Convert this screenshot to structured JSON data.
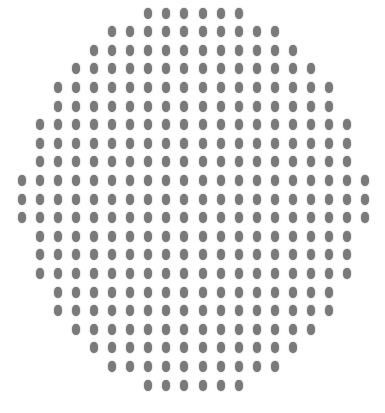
{
  "figure": {
    "dot_color": "#7a7a7a",
    "background": "#ffffff",
    "grid": {
      "origin_x": 22,
      "origin_y": 13,
      "col_spacing": 18.05,
      "row_spacing": 18.6,
      "columns": 20,
      "dot_width": 8,
      "dot_height": 11
    },
    "rows": [
      {
        "start_col": 7,
        "count": 6
      },
      {
        "start_col": 5,
        "count": 10
      },
      {
        "start_col": 4,
        "count": 12
      },
      {
        "start_col": 3,
        "count": 14
      },
      {
        "start_col": 2,
        "count": 16
      },
      {
        "start_col": 2,
        "count": 16
      },
      {
        "start_col": 1,
        "count": 18
      },
      {
        "start_col": 1,
        "count": 18
      },
      {
        "start_col": 1,
        "count": 18
      },
      {
        "start_col": 0,
        "count": 20
      },
      {
        "start_col": 0,
        "count": 20
      },
      {
        "start_col": 0,
        "count": 20
      },
      {
        "start_col": 1,
        "count": 18
      },
      {
        "start_col": 1,
        "count": 18
      },
      {
        "start_col": 1,
        "count": 18
      },
      {
        "start_col": 2,
        "count": 16
      },
      {
        "start_col": 2,
        "count": 16
      },
      {
        "start_col": 3,
        "count": 14
      },
      {
        "start_col": 4,
        "count": 12
      },
      {
        "start_col": 5,
        "count": 10
      },
      {
        "start_col": 7,
        "count": 6
      }
    ],
    "total_dots": 316
  }
}
